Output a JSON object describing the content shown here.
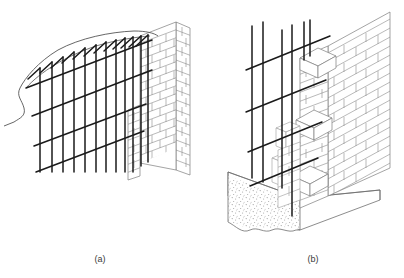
{
  "figure": {
    "background_color": "#ffffff",
    "rebar_color": "#1a1a1a",
    "masonry_line_color": "#7d7d7d",
    "concrete_line_color": "#6e6e6e",
    "stipple_color": "#9a9a9a",
    "caption_color": "#3a3a3a",
    "width": 404,
    "height": 278
  },
  "panels": [
    {
      "id": "a",
      "caption": "(a)",
      "description": "Isometric cut-away of a reinforced masonry wall showing a vertical and horizontal reinforcing bar grid with hooked bar ends projecting above a broken grout section, meeting a brick wall face at the right.",
      "elements": {
        "rebar_grid_label": "vertical and horizontal reinforcement grid",
        "hooked_bars_label": "hooked bar ends",
        "break_line_label": "broken grout boundary",
        "brick_face_label": "brick wall face",
        "brick_return_label": "brick corner return"
      },
      "counts": {
        "vertical_bars": 12,
        "horizontal_bars": 4,
        "hook_arms": 12,
        "brick_courses": 17
      }
    },
    {
      "id": "b",
      "caption": "(b)",
      "description": "Isometric view of a reinforced masonry corner rising from a concrete footing, with vertical dowels and horizontal bars passing through a toothed brick corner and embedded pilaster blocks.",
      "elements": {
        "rebar_grid_label": "vertical dowels and horizontal bars",
        "footing_label": "concrete footing slab",
        "footing_texture_label": "stippled concrete fill",
        "break_line_label": "broken footing edge",
        "brick_corner_label": "toothed brick corner",
        "pilaster_label": "embedded pilaster blocks",
        "brick_face_label": "brick wall face"
      },
      "counts": {
        "vertical_bars": 6,
        "horizontal_bars": 4,
        "brick_courses": 18,
        "pilaster_blocks": 3
      }
    }
  ]
}
